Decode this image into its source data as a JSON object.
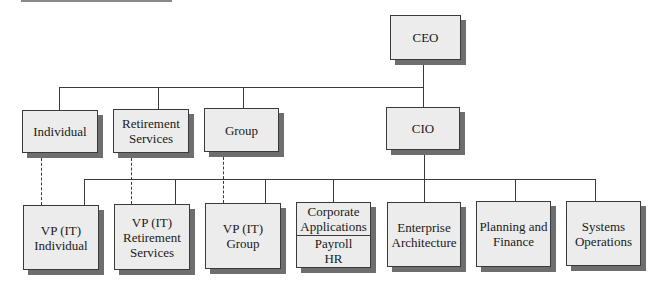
{
  "chart": {
    "nodes": {
      "ceo": {
        "lines": [
          "CEO"
        ]
      },
      "individual": {
        "lines": [
          "Individual"
        ]
      },
      "retirement_services": {
        "lines": [
          "Retirement",
          "Services"
        ]
      },
      "group": {
        "lines": [
          "Group"
        ]
      },
      "cio": {
        "lines": [
          "CIO"
        ]
      },
      "vp_individual": {
        "lines": [
          "VP (IT)",
          "Individual"
        ]
      },
      "vp_retirement": {
        "lines": [
          "VP (IT)",
          "Retirement",
          "Services"
        ]
      },
      "vp_group": {
        "lines": [
          "VP (IT)",
          "Group"
        ]
      },
      "corporate_applications": {
        "top": [
          "Corporate",
          "Applications"
        ],
        "bottom": [
          "Payroll",
          "HR"
        ]
      },
      "enterprise_architecture": {
        "lines": [
          "Enterprise",
          "Architecture"
        ]
      },
      "planning_finance": {
        "lines": [
          "Planning and",
          "Finance"
        ]
      },
      "systems_operations": {
        "lines": [
          "Systems",
          "Operations"
        ]
      }
    },
    "colors": {
      "box_fill": "#ececec",
      "box_border": "#3a3a3a",
      "shadow": "#6e6e6e",
      "connector": "#3a3a3a"
    }
  }
}
